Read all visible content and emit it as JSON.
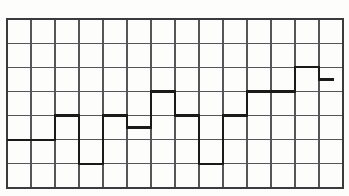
{
  "chart_data": {
    "type": "line",
    "subtype": "step-post",
    "title": "",
    "subtitle": "",
    "xlabel": "",
    "ylabel": "",
    "categories": [
      "1",
      "2",
      "3",
      "4",
      "5",
      "6",
      "7",
      "8",
      "9",
      "10",
      "11",
      "12",
      "13",
      "14"
    ],
    "x": [
      1,
      2,
      3,
      4,
      5,
      6,
      7,
      8,
      9,
      10,
      11,
      12,
      13,
      14
    ],
    "values": [
      2,
      2,
      3,
      1,
      3,
      2.5,
      4,
      3,
      1,
      3,
      4,
      4,
      5,
      4.5
    ],
    "ylim": [
      0,
      7
    ],
    "xlim": [
      0,
      14
    ],
    "yticks": [
      0,
      1,
      2,
      3,
      4,
      5,
      6,
      7
    ],
    "xticks": [
      0,
      1,
      2,
      3,
      4,
      5,
      6,
      7,
      8,
      9,
      10,
      11,
      12,
      13,
      14
    ],
    "xtick_labels": [],
    "ytick_labels": [],
    "grid": true,
    "grid_columns": 14,
    "grid_rows": 7,
    "legend": [],
    "legend_position": "none",
    "annotations": [],
    "series": [
      {
        "name": "step-series",
        "values": [
          2,
          2,
          3,
          1,
          3,
          2.5,
          4,
          3,
          1,
          3,
          4,
          4,
          5,
          4.5
        ]
      }
    ]
  },
  "style": {
    "background_color": "#fdfdfc",
    "grid_line_color": "#55565a",
    "border_color": "#3a3b3e",
    "data_line_color": "#1a1a1a",
    "grid_line_width": 1.1,
    "border_width": 1.6,
    "data_line_width": 2.4
  },
  "geometry": {
    "plot_left": 7,
    "plot_top": 19,
    "plot_right": 343,
    "plot_bottom": 188,
    "cell_width": 24,
    "cell_height": 24.14,
    "line_start_x": 7,
    "line_end_x": 334
  }
}
